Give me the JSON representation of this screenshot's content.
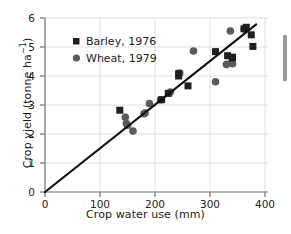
{
  "chart_data": {
    "type": "scatter",
    "title": "",
    "xlabel": "Crop water use (mm)",
    "ylabel": "Crop yield (tonne ha⁻¹)",
    "xlim": [
      0,
      400
    ],
    "ylim": [
      0,
      6
    ],
    "xticks": [
      0,
      100,
      200,
      300,
      400
    ],
    "yticks": [
      0,
      1,
      2,
      3,
      4,
      5,
      6
    ],
    "grid": true,
    "legend_position": "upper-left",
    "series": [
      {
        "name": "Barley, 1976",
        "marker": "square",
        "color": "#1f1f1f",
        "points": [
          [
            136,
            2.82
          ],
          [
            212,
            3.18
          ],
          [
            224,
            3.4
          ],
          [
            243,
            4.08
          ],
          [
            243,
            4.0
          ],
          [
            260,
            3.66
          ],
          [
            310,
            4.84
          ],
          [
            332,
            4.7
          ],
          [
            340,
            4.62
          ],
          [
            341,
            4.65
          ],
          [
            362,
            5.63
          ],
          [
            366,
            5.68
          ],
          [
            375,
            5.42
          ],
          [
            378,
            5.02
          ]
        ]
      },
      {
        "name": "Wheat, 1979",
        "marker": "circle",
        "color": "#5a5a5a",
        "points": [
          [
            146,
            2.58
          ],
          [
            148,
            2.36
          ],
          [
            150,
            2.3
          ],
          [
            160,
            2.1
          ],
          [
            180,
            2.7
          ],
          [
            182,
            2.72
          ],
          [
            190,
            3.05
          ],
          [
            210,
            3.18
          ],
          [
            228,
            3.45
          ],
          [
            245,
            4.1
          ],
          [
            270,
            4.86
          ],
          [
            310,
            3.8
          ],
          [
            330,
            4.4
          ],
          [
            341,
            4.42
          ],
          [
            337,
            5.55
          ],
          [
            362,
            5.62
          ]
        ]
      }
    ],
    "trend_line": {
      "label": "regression line",
      "x_start": 0,
      "y_start": 0,
      "x_end": 384,
      "y_end": 5.78
    }
  },
  "legend": {
    "entries": [
      {
        "label": "Barley, 1976",
        "marker": "square"
      },
      {
        "label": "Wheat, 1979",
        "marker": "circle"
      }
    ]
  },
  "axis_labels": {
    "x": "Crop water use (mm)",
    "y_prefix": "Crop yield (tonne ha",
    "y_exponent": "−1",
    "y_suffix": ")"
  },
  "scrollbar": {
    "present": true
  }
}
